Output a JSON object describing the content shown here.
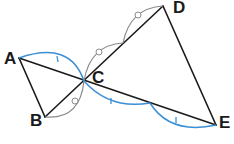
{
  "diagram": {
    "type": "geometry",
    "points": {
      "A": {
        "label": "A",
        "x": 19,
        "y": 58
      },
      "B": {
        "label": "B",
        "x": 45,
        "y": 117
      },
      "C": {
        "label": "C",
        "x": 84,
        "y": 81
      },
      "D": {
        "label": "D",
        "x": 163,
        "y": 6
      },
      "E": {
        "label": "E",
        "x": 216,
        "y": 125
      }
    },
    "segments": [
      "AB",
      "AE",
      "BD",
      "DE"
    ],
    "equal_marks": {
      "circle": [
        "BC",
        "CM",
        "MD"
      ],
      "tick": [
        "AC",
        "CN",
        "NE"
      ]
    },
    "colors": {
      "line": "#1a1a1a",
      "circle_arc": "#8a8a8a",
      "tick_arc": "#3a8fd6"
    }
  }
}
